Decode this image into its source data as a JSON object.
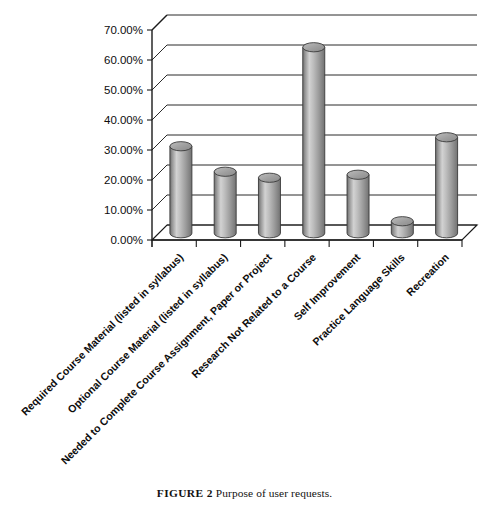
{
  "figure": {
    "caption_label": "FIGURE 2",
    "caption_text": "Purpose of user requests."
  },
  "chart_data": {
    "type": "bar",
    "title": "",
    "subtitle": "",
    "xlabel": "",
    "ylabel": "",
    "ylim": [
      0,
      70
    ],
    "grid": true,
    "legend": "none",
    "style": "3d-cylinder",
    "bar_color": "#a8a8a8",
    "categories": [
      "Required Course Material (listed in syllabus)",
      "Optional Course Material (listed in syllabus)",
      "Needed to Complete Course Assignment, Paper or Project",
      "Research Not Related to a Course",
      "Self Improvement",
      "Practice Language Skills",
      "Recreation"
    ],
    "values": [
      29.0,
      20.5,
      18.5,
      62.0,
      19.5,
      4.0,
      32.0
    ],
    "value_labels": [
      "29.00%",
      "20.50%",
      "18.50%",
      "62.00%",
      "19.50%",
      "4.00%",
      "32.00%"
    ],
    "ytick_labels": [
      "0.00%",
      "10.00%",
      "20.00%",
      "30.00%",
      "40.00%",
      "50.00%",
      "60.00%",
      "70.00%"
    ],
    "ytick_values": [
      0,
      10,
      20,
      30,
      40,
      50,
      60,
      70
    ]
  }
}
